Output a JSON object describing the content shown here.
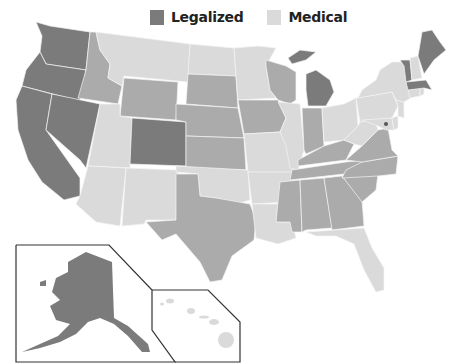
{
  "legend": {
    "items": [
      {
        "label": "Legalized",
        "color": "#7b7b7b"
      },
      {
        "label": "Medical",
        "color": "#dadada"
      }
    ]
  },
  "colors": {
    "legalized": "#7b7b7b",
    "medical": "#dadada",
    "none": "#ababab",
    "inset_border": "#333333"
  },
  "states": {
    "legalized": [
      "Washington",
      "Oregon",
      "California",
      "Nevada",
      "Colorado",
      "Michigan",
      "Maine",
      "Vermont",
      "Massachusetts",
      "District of Columbia",
      "Alaska"
    ],
    "medical": [
      "Montana",
      "Utah",
      "Arizona",
      "New Mexico",
      "North Dakota",
      "Minnesota",
      "Oklahoma",
      "Missouri",
      "Illinois",
      "Arkansas",
      "Louisiana",
      "Ohio",
      "West Virginia",
      "Pennsylvania",
      "New York",
      "New Hampshire",
      "Connecticut",
      "Rhode Island",
      "New Jersey",
      "Delaware",
      "Maryland",
      "Florida",
      "Hawaii"
    ],
    "none": [
      "Idaho",
      "Wyoming",
      "South Dakota",
      "Nebraska",
      "Kansas",
      "Iowa",
      "Wisconsin",
      "Texas",
      "Indiana",
      "Kentucky",
      "Tennessee",
      "Mississippi",
      "Alabama",
      "Georgia",
      "South Carolina",
      "North Carolina",
      "Virginia"
    ]
  },
  "insets": [
    {
      "name": "Alaska"
    },
    {
      "name": "Hawaii"
    }
  ]
}
